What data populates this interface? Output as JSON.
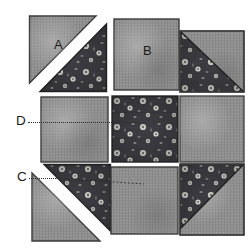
{
  "figure": {
    "type": "quilt-block-piecing-diagram",
    "title": "",
    "grid": {
      "rows": 3,
      "cols": 3
    },
    "background_color": "#ffffff"
  },
  "fabrics": {
    "solid": {
      "name": "solid-gray-fabric",
      "base_color": "#8e8e8e",
      "shade_light": "#a6a6a6",
      "shade_dark": "#767676",
      "outline_color": "#3a3a3a"
    },
    "floral": {
      "name": "dark-floral-fabric",
      "base_color": "#3c3c42",
      "motif_color": "#d8d8d0",
      "motif_shadow": "#6e6e72",
      "outline_color": "#262626"
    },
    "gap": {
      "name": "white-seam-gap",
      "color": "#ffffff"
    }
  },
  "labels": [
    {
      "id": "A",
      "text": "A",
      "target": "top-left-unit-solid-triangle"
    },
    {
      "id": "B",
      "text": "B",
      "target": "top-center-unit-solid-square"
    },
    {
      "id": "C",
      "text": "C",
      "target": "bottom-left-unit-seam-line"
    },
    {
      "id": "D",
      "text": "D",
      "target": "middle-left-unit-seam-line"
    }
  ],
  "leaders": [
    {
      "id": "leader-D",
      "from_label": "D",
      "style": "dotted",
      "direction": "horizontal"
    },
    {
      "id": "leader-C",
      "from_label": "C",
      "style": "dotted",
      "direction": "horizontal"
    }
  ],
  "pieces": [
    {
      "id": "top-left",
      "name": "half-square-triangle-unit-A",
      "row": 1,
      "col": 1,
      "kind": "split-diagonal-with-gap",
      "diagonal": "tl-br",
      "upper_left_fabric": "solid",
      "lower_right_fabric": "floral",
      "label": "A"
    },
    {
      "id": "top-center",
      "name": "solid-square-unit-B",
      "row": 1,
      "col": 2,
      "kind": "plain-square",
      "fabric": "solid",
      "label": "B"
    },
    {
      "id": "top-right",
      "name": "half-square-triangle-unit-top-right",
      "row": 1,
      "col": 3,
      "kind": "split-diagonal-joined",
      "diagonal": "tl-br",
      "upper_left_fabric": "floral",
      "lower_right_fabric": "solid",
      "label": ""
    },
    {
      "id": "middle-left",
      "name": "solid-square-unit-middle-left",
      "row": 2,
      "col": 1,
      "kind": "plain-square",
      "fabric": "solid",
      "label": "D"
    },
    {
      "id": "middle-center",
      "name": "floral-square-unit-center",
      "row": 2,
      "col": 2,
      "kind": "plain-square",
      "fabric": "floral",
      "label": ""
    },
    {
      "id": "middle-right",
      "name": "solid-square-unit-middle-right",
      "row": 2,
      "col": 3,
      "kind": "plain-square",
      "fabric": "solid",
      "label": ""
    },
    {
      "id": "bottom-left",
      "name": "half-square-triangle-unit-C",
      "row": 3,
      "col": 1,
      "kind": "split-diagonal-with-gap",
      "diagonal": "tl-br",
      "upper_right_fabric": "floral",
      "lower_left_fabric": "solid",
      "label": "C"
    },
    {
      "id": "bottom-center",
      "name": "solid-square-unit-bottom-center",
      "row": 3,
      "col": 2,
      "kind": "plain-square",
      "fabric": "solid",
      "label": ""
    },
    {
      "id": "bottom-right",
      "name": "half-square-triangle-unit-bottom-right",
      "row": 3,
      "col": 3,
      "kind": "split-diagonal-joined",
      "diagonal": "tr-bl",
      "upper_left_fabric": "floral",
      "lower_right_fabric": "solid",
      "label": ""
    }
  ]
}
